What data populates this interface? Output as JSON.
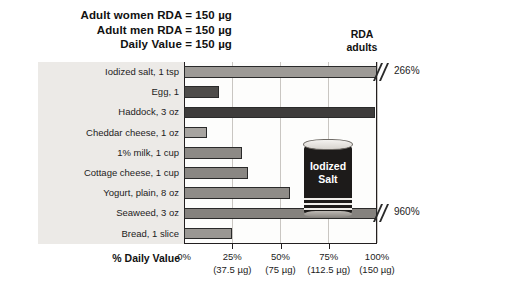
{
  "header": {
    "lines": [
      "Adult women RDA = 150 µg",
      "Adult men RDA = 150 µg",
      "Daily Value = 150 µg"
    ]
  },
  "rda_marker": {
    "line1": "RDA",
    "line2": "adults"
  },
  "axis": {
    "title": "% Daily Value",
    "ticks": [
      {
        "label": "0%",
        "sub": "",
        "value": 0
      },
      {
        "label": "25%",
        "sub": "(37.5 µg)",
        "value": 25
      },
      {
        "label": "50%",
        "sub": "(75 µg)",
        "value": 50
      },
      {
        "label": "75%",
        "sub": "(112.5 µg)",
        "value": 75
      },
      {
        "label": "100%",
        "sub": "(150 µg)",
        "value": 100
      }
    ]
  },
  "illustration": {
    "name": "iodized-salt-can",
    "line1": "Iodized",
    "line2": "Salt"
  },
  "chart_data": {
    "type": "bar",
    "orientation": "horizontal",
    "title": "",
    "xlabel": "% Daily Value",
    "ylabel": "",
    "xlim": [
      0,
      100
    ],
    "grid": true,
    "legend": "none",
    "reference_line": {
      "label": "RDA adults",
      "value": 100
    },
    "nutrient": "Iodine",
    "daily_value_ug": 150,
    "categories": [
      "Iodized salt, 1 tsp",
      "Egg, 1",
      "Haddock, 3 oz",
      "Cheddar cheese, 1 oz",
      "1% milk, 1 cup",
      "Cottage cheese, 1 cup",
      "Yogurt, plain, 8 oz",
      "Seaweed, 3 oz",
      "Bread, 1 slice"
    ],
    "values": [
      266,
      18,
      99,
      12,
      30,
      33,
      55,
      960,
      25
    ],
    "clipped": [
      true,
      false,
      false,
      false,
      false,
      false,
      false,
      true,
      false
    ],
    "value_labels": [
      "266%",
      "",
      "",
      "",
      "",
      "",
      "",
      "960%",
      ""
    ],
    "bar_colors": [
      "#9d9a96",
      "#4e4c4a",
      "#3e3c3b",
      "#a7a4a0",
      "#8d8a86",
      "#8a8783",
      "#8f8c88",
      "#85827e",
      "#9a9793"
    ]
  }
}
